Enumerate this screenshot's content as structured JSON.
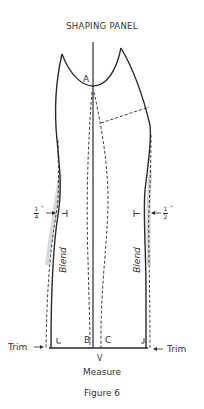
{
  "title": "SHAPING PANEL",
  "caption": "Figure 6",
  "points": {
    "a": "A",
    "b": "B",
    "c": "C"
  },
  "labels": {
    "blend_left": "Blend",
    "blend_right": "Blend",
    "trim_left": "Trim",
    "trim_right": "Trim",
    "measure": "Measure",
    "measure_symbol": "V"
  },
  "measurements": {
    "left": {
      "numerator": "1",
      "denominator": "4",
      "unit": "\""
    },
    "right": {
      "numerator": "1",
      "denominator": "2",
      "unit": "\""
    }
  },
  "colors": {
    "line": "#2a2a2a",
    "shade": "#d9d9d9",
    "background": "#ffffff"
  }
}
